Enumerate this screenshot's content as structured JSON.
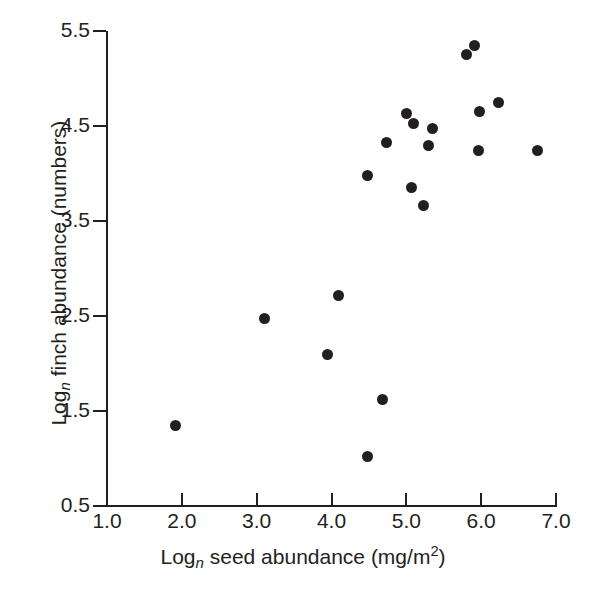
{
  "chart_data": {
    "type": "scatter",
    "title": "",
    "xlabel_parts": {
      "prefix": "Log",
      "sub": "n",
      "rest": " seed abundance (mg/m",
      "sup": "2",
      "tail": ")"
    },
    "ylabel_parts": {
      "prefix": "Log",
      "sub": "n",
      "rest": " finch abundance (numbers)"
    },
    "xlabel": "Log_n seed abundance (mg/m2)",
    "ylabel": "Log_n finch abundance (numbers)",
    "xlim": [
      1.0,
      7.0
    ],
    "ylim": [
      0.5,
      5.5
    ],
    "xticks": [
      "1.0",
      "2.0",
      "3.0",
      "4.0",
      "5.0",
      "6.0",
      "7.0"
    ],
    "xtick_values": [
      1.0,
      2.0,
      3.0,
      4.0,
      5.0,
      6.0,
      7.0
    ],
    "yticks": [
      "0.5",
      "1.5",
      "2.5",
      "3.5",
      "4.5",
      "5.5"
    ],
    "ytick_values": [
      0.5,
      1.5,
      2.5,
      3.5,
      4.5,
      5.5
    ],
    "grid": false,
    "legend": null,
    "marker": {
      "shape": "circle",
      "color": "#231f20",
      "size_px": 11
    },
    "points": [
      {
        "x": 1.92,
        "y": 1.35
      },
      {
        "x": 3.11,
        "y": 2.47
      },
      {
        "x": 3.94,
        "y": 2.09
      },
      {
        "x": 4.09,
        "y": 2.72
      },
      {
        "x": 4.48,
        "y": 1.02
      },
      {
        "x": 4.48,
        "y": 3.98
      },
      {
        "x": 4.68,
        "y": 1.62
      },
      {
        "x": 4.73,
        "y": 4.33
      },
      {
        "x": 5.0,
        "y": 4.63
      },
      {
        "x": 5.07,
        "y": 3.85
      },
      {
        "x": 5.1,
        "y": 4.53
      },
      {
        "x": 5.23,
        "y": 3.66
      },
      {
        "x": 5.3,
        "y": 4.29
      },
      {
        "x": 5.35,
        "y": 4.47
      },
      {
        "x": 5.8,
        "y": 5.25
      },
      {
        "x": 5.91,
        "y": 5.35
      },
      {
        "x": 5.97,
        "y": 4.24
      },
      {
        "x": 5.98,
        "y": 4.65
      },
      {
        "x": 6.23,
        "y": 4.75
      },
      {
        "x": 6.75,
        "y": 4.24
      }
    ]
  },
  "colors": {
    "axis": "#231f20",
    "marker": "#231f20",
    "background": "#ffffff"
  }
}
